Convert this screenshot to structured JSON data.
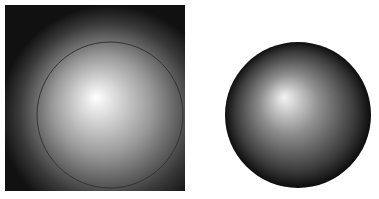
{
  "figure": {
    "panels": [
      {
        "name": "square-radial-gradient",
        "colors": {
          "highlight": "#ffffff",
          "mid": "#8a8a8a",
          "edge": "#111111",
          "outline": "#333333"
        }
      },
      {
        "name": "sphere-radial-gradient",
        "colors": {
          "highlight": "#f4f4f4",
          "mid": "#7a7a7a",
          "edge": "#0a0a0a"
        }
      }
    ]
  }
}
